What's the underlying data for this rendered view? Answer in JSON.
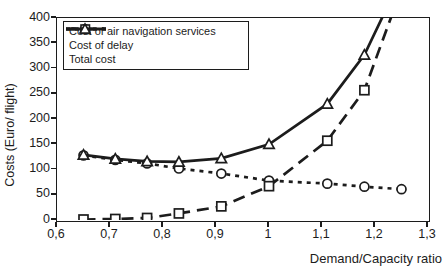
{
  "chart_data": {
    "type": "line",
    "title": "",
    "xlabel": "Demand/Capacity ratio",
    "ylabel": "Costs (Euro/ flight)",
    "xlim": [
      0.6,
      1.3
    ],
    "ylim": [
      0,
      400
    ],
    "grid": false,
    "legend_position": "top-left",
    "ink_color": "#1c1c1c",
    "x_ticks": [
      {
        "v": 0.6,
        "label": "0,6"
      },
      {
        "v": 0.7,
        "label": "0,7"
      },
      {
        "v": 0.8,
        "label": "0,8"
      },
      {
        "v": 0.9,
        "label": "0,9"
      },
      {
        "v": 1.0,
        "label": "1"
      },
      {
        "v": 1.1,
        "label": "1,1"
      },
      {
        "v": 1.2,
        "label": "1,2"
      },
      {
        "v": 1.3,
        "label": "1,3"
      }
    ],
    "y_ticks": [
      {
        "v": 0,
        "label": "0"
      },
      {
        "v": 50,
        "label": "50"
      },
      {
        "v": 100,
        "label": "100"
      },
      {
        "v": 150,
        "label": "150"
      },
      {
        "v": 200,
        "label": "200"
      },
      {
        "v": 250,
        "label": "250"
      },
      {
        "v": 300,
        "label": "300"
      },
      {
        "v": 350,
        "label": "350"
      },
      {
        "v": 400,
        "label": "400"
      }
    ],
    "series": [
      {
        "name": "Cost of air navigation services",
        "marker": "circle",
        "dash": "dotted",
        "x": [
          0.65,
          0.71,
          0.77,
          0.83,
          0.91,
          1.0,
          1.11,
          1.18,
          1.25
        ],
        "y": [
          128,
          119,
          112,
          102,
          92,
          78,
          72,
          66,
          61
        ]
      },
      {
        "name": "Cost of delay",
        "marker": "square",
        "dash": "long-dash",
        "x": [
          0.65,
          0.71,
          0.77,
          0.83,
          0.91,
          1.0,
          1.11,
          1.18
        ],
        "y": [
          1,
          2,
          4,
          13,
          27,
          67,
          157,
          257
        ],
        "line_extension": {
          "x": [
            1.235
          ],
          "y": [
            415
          ]
        }
      },
      {
        "name": "Total cost",
        "marker": "triangle",
        "dash": "solid",
        "x": [
          0.65,
          0.71,
          0.77,
          0.83,
          0.91,
          1.0,
          1.11,
          1.18
        ],
        "y": [
          129,
          121,
          116,
          115,
          122,
          150,
          230,
          327
        ],
        "line_extension": {
          "x": [
            1.22
          ],
          "y": [
            415
          ]
        }
      }
    ]
  }
}
